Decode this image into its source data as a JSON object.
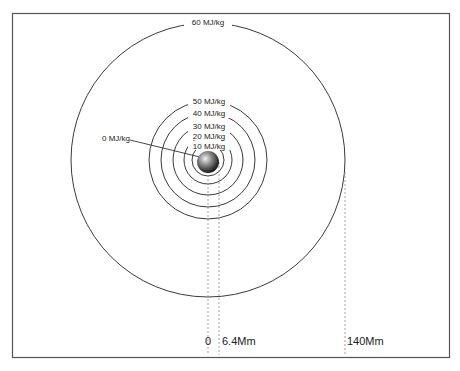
{
  "diagram": {
    "center": {
      "x": 208,
      "y": 160
    },
    "planet_radius": 11,
    "inner_rings": [
      {
        "label": "10 MJ/kg",
        "r": 16
      },
      {
        "label": "20 MJ/kg",
        "r": 24
      },
      {
        "label": "30 MJ/kg",
        "r": 35
      },
      {
        "label": "40 MJ/kg",
        "r": 47
      },
      {
        "label": "50 MJ/kg",
        "r": 59
      }
    ],
    "outer_ring": {
      "label": "60 MJ/kg",
      "r": 137
    },
    "surface_label": "0 MJ/kg",
    "distance_markers": [
      {
        "label": "0",
        "x": 208
      },
      {
        "label": "6.4Mm",
        "x": 219
      },
      {
        "label": "140Mm",
        "x": 345
      }
    ],
    "colors": {
      "line": "#3a3a3a",
      "dash": "#8a8a8a",
      "frame": "#555555"
    }
  }
}
